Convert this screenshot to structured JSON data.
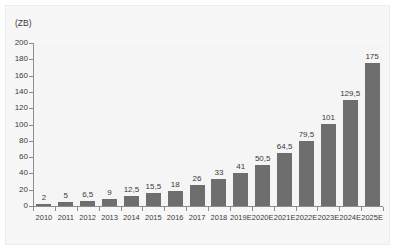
{
  "chart_data": {
    "type": "bar",
    "title": "",
    "subtitle": "",
    "xlabel": "",
    "ylabel": "(ZB)",
    "unit_label": "(ZB)",
    "ylim": [
      0,
      200
    ],
    "y_ticks": [
      0,
      20,
      40,
      60,
      80,
      100,
      120,
      140,
      160,
      180,
      200
    ],
    "y_tick_labels": [
      "0",
      "20",
      "40",
      "60",
      "80",
      "100",
      "120",
      "140",
      "160",
      "180",
      "200"
    ],
    "grid": false,
    "legend": null,
    "legend_position": "none",
    "bar_color": "#6e6e6e",
    "plot_background": "#f5f5f5",
    "axis_color": "#8d8d8d",
    "text_color": "#3a3a3a",
    "decimal_separator": ",",
    "categories": [
      "2010",
      "2011",
      "2012",
      "2013",
      "2014",
      "2015",
      "2016",
      "2017",
      "2018",
      "2019E",
      "2020E",
      "2021E",
      "2022E",
      "2023E",
      "2024E",
      "2025E"
    ],
    "values": [
      2,
      5,
      6.5,
      9,
      12.5,
      15.5,
      18,
      26,
      33,
      41,
      50.5,
      64.5,
      79.5,
      101,
      129.5,
      175
    ],
    "value_labels": [
      "2",
      "5",
      "6,5",
      "9",
      "12,5",
      "15,5",
      "18",
      "26",
      "33",
      "41",
      "50,5",
      "64,5",
      "79,5",
      "101",
      "129,5",
      "175"
    ]
  },
  "watermark": {
    "text": ""
  }
}
